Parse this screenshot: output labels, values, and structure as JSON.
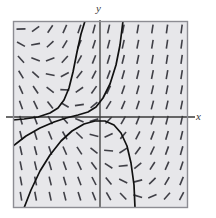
{
  "figure": {
    "kind": "slope-field-diagram",
    "background_color": "#ffffff",
    "plot": {
      "fill_color": "#e7e7ea",
      "border_color": "#8d8d93",
      "left": 13,
      "top": 21,
      "width": 175,
      "height": 187
    },
    "axes": {
      "color": "#3a3a3a",
      "x_axis_y": 117,
      "y_axis_x": 100,
      "x_label": "x",
      "y_label": "y"
    },
    "slope_marks": {
      "color": "#3f3f46",
      "length": 9,
      "thickness": 1.6,
      "columns": 12,
      "rows": 12,
      "x_start": 21,
      "y_start": 29,
      "x_step": 14.6,
      "y_step": 15.2,
      "note": "Tick slope at each grid point follows dy/dx = (x + y) style saddle flow: near-vertical far from center, flattening to horizontal along the separatrix through the saddle left of the origin."
    },
    "curves": {
      "color": "#111111",
      "thickness": 1.7,
      "count": 3,
      "items": [
        {
          "name": "upper-left-rising-curve",
          "points": "13,120 24,119 38,117 50,113 58,108 64,100 69,88 73,72 77,52 81,34 85,21"
        },
        {
          "name": "central-s-curve",
          "points": "13,146 26,136 40,128 54,122 66,118 78,115 88,112 96,107 103,98 110,84 116,65 120,45 123,21"
        },
        {
          "name": "descending-parabola-curve",
          "points": "24,208 31,190 40,171 50,155 61,141 72,131 84,124 95,121 105,121 114,125 121,133 127,146 131,163 134,185 135,208"
        }
      ]
    }
  }
}
